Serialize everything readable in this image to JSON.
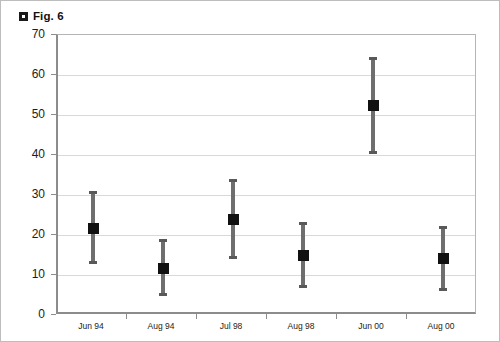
{
  "figure": {
    "title": "Fig. 6",
    "bullet_icon": "square-bullet-icon"
  },
  "chart_data": {
    "type": "scatter",
    "title": "Fig. 6",
    "xlabel": "",
    "ylabel": "",
    "categories": [
      "Jun 94",
      "Aug 94",
      "Jul 98",
      "Aug 98",
      "Jun 00",
      "Aug 00"
    ],
    "values": [
      21.7,
      11.6,
      23.8,
      15.0,
      52.4,
      14.1
    ],
    "error_low": [
      12.8,
      4.7,
      13.9,
      6.7,
      40.3,
      5.9
    ],
    "error_high": [
      31.0,
      19.0,
      34.0,
      23.2,
      64.6,
      22.3
    ],
    "series": [
      {
        "name": "mean with range",
        "points": [
          {
            "category": "Jun 94",
            "value": 21.7,
            "low": 12.8,
            "high": 31.0
          },
          {
            "category": "Aug 94",
            "value": 11.6,
            "low": 4.7,
            "high": 19.0
          },
          {
            "category": "Jul 98",
            "value": 23.8,
            "low": 13.9,
            "high": 34.0
          },
          {
            "category": "Aug 98",
            "value": 15.0,
            "low": 6.7,
            "high": 23.2
          },
          {
            "category": "Jun 00",
            "value": 52.4,
            "low": 40.3,
            "high": 64.6
          },
          {
            "category": "Aug 00",
            "value": 14.1,
            "low": 5.9,
            "high": 22.3
          }
        ]
      }
    ],
    "ylim": [
      0,
      70
    ],
    "yticks": [
      0,
      10,
      20,
      30,
      40,
      50,
      60,
      70
    ],
    "ytick_labels": [
      "0",
      "10",
      "20",
      "30",
      "40",
      "50",
      "60",
      "70"
    ],
    "grid": true,
    "grid_axis": "y",
    "legend": false,
    "marker_color": "#111111",
    "errorbar_color": "#6e6e6e",
    "gridline_color": "#d9d9d9",
    "axis_color": "#8c8c8c"
  }
}
